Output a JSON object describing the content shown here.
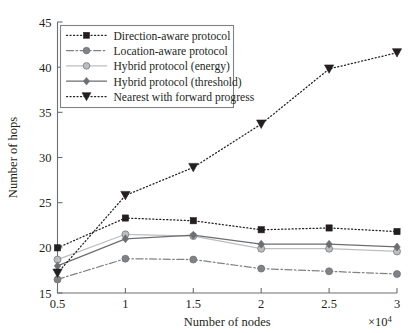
{
  "chart_data": {
    "type": "line",
    "title": "",
    "xlabel": "Number of nodes",
    "ylabel": "Number of hops",
    "x_multiplier": "×10",
    "x_multiplier_exp": "4",
    "x": [
      0.5,
      1,
      1.5,
      2,
      2.5,
      3
    ],
    "xticklabels": [
      "0.5",
      "1",
      "1.5",
      "2",
      "2.5",
      "3"
    ],
    "yticklabels": [
      "15",
      "20",
      "25",
      "30",
      "35",
      "40",
      "45"
    ],
    "xlim": [
      0.5,
      3
    ],
    "ylim": [
      15,
      45
    ],
    "grid": false,
    "legend_position": "upper left",
    "series": [
      {
        "name": "Direction-aware protocol",
        "values": [
          20.0,
          23.3,
          23.0,
          22.0,
          22.2,
          21.8
        ],
        "color": "#231f20",
        "marker": "square",
        "linestyle": "dotted"
      },
      {
        "name": "Location-aware protocol",
        "values": [
          16.5,
          18.8,
          18.7,
          17.7,
          17.4,
          17.1
        ],
        "color": "#808285",
        "marker": "circle",
        "linestyle": "dashdot"
      },
      {
        "name": "Hybrid protocol (energy)",
        "values": [
          18.7,
          21.5,
          21.3,
          19.9,
          19.9,
          19.6
        ],
        "color": "#bcbec0",
        "marker": "circle",
        "linestyle": "solid"
      },
      {
        "name": "Hybrid protocol (threshold)",
        "values": [
          18.0,
          21.0,
          21.4,
          20.4,
          20.4,
          20.1
        ],
        "color": "#6d6e71",
        "marker": "diamond",
        "linestyle": "solid"
      },
      {
        "name": "Nearest with forward progress",
        "values": [
          17.2,
          25.8,
          28.9,
          33.7,
          39.8,
          41.6
        ],
        "color": "#231f20",
        "marker": "triangle-down",
        "linestyle": "dotted"
      }
    ]
  }
}
